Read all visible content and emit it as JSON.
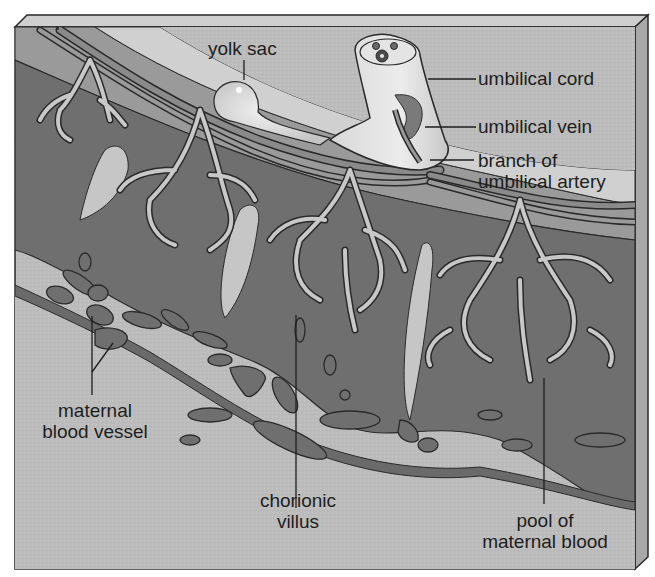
{
  "figure": {
    "colors": {
      "background": "#ffffff",
      "block_face": "#b9b9b9",
      "block_top": "#cfcfcf",
      "block_side": "#a8a8a8",
      "maternal_blood": "#6f6f6f",
      "villus_fill": "#bdbdbd",
      "membrane_light": "#d4d4d4",
      "outline": "#2a2a2a",
      "text": "#1e1e1e"
    }
  },
  "labels": {
    "yolk_sac": "yolk sac",
    "umbilical_cord": "umbilical cord",
    "umbilical_vein": "umbilical vein",
    "branch_of_umbilical_artery": {
      "line1": "branch of",
      "line2": "umbilical artery"
    },
    "maternal_blood_vessel": {
      "line1": "maternal",
      "line2": "blood vessel"
    },
    "chorionic_villus": {
      "line1": "chorionic",
      "line2": "villus"
    },
    "pool_of_maternal_blood": {
      "line1": "pool of",
      "line2": "maternal blood"
    }
  }
}
